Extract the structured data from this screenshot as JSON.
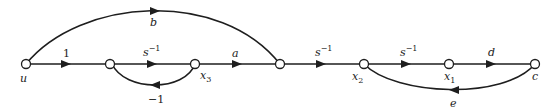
{
  "diagram": {
    "type": "signal-flow-graph",
    "nodes": [
      {
        "id": "u",
        "label": "u"
      },
      {
        "id": "n1",
        "label": ""
      },
      {
        "id": "x3",
        "label": "x",
        "sub": "3"
      },
      {
        "id": "n4",
        "label": ""
      },
      {
        "id": "x2",
        "label": "x",
        "sub": "2"
      },
      {
        "id": "x1",
        "label": "x",
        "sub": "1"
      },
      {
        "id": "c",
        "label": "c"
      }
    ],
    "edges": [
      {
        "from": "u",
        "to": "n1",
        "gain": "1"
      },
      {
        "from": "n1",
        "to": "x3",
        "gain": "s",
        "sup": "−1"
      },
      {
        "from": "x3",
        "to": "n1",
        "gain": "−1"
      },
      {
        "from": "x3",
        "to": "n4",
        "gain": "a"
      },
      {
        "from": "u",
        "to": "n4",
        "gain": "b"
      },
      {
        "from": "n4",
        "to": "x2",
        "gain": "s",
        "sup": "−1"
      },
      {
        "from": "x2",
        "to": "x1",
        "gain": "s",
        "sup": "−1"
      },
      {
        "from": "x1",
        "to": "c",
        "gain": "d"
      },
      {
        "from": "c",
        "to": "x2",
        "gain": "e"
      }
    ]
  }
}
